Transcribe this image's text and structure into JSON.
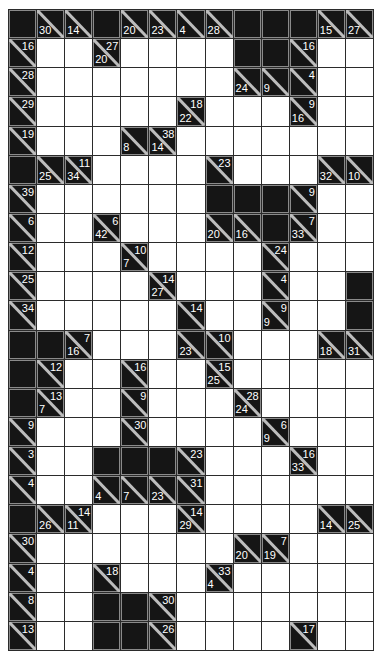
{
  "puzzle": {
    "type": "kakuro",
    "cols": 13,
    "rows": 22,
    "legend": {
      "B": "blocked cell",
      "W": "empty white entry cell",
      "clue": "[down_sum, across_sum] (null when absent)"
    },
    "colors": {
      "block": "#151515",
      "white": "#ffffff",
      "grid_line": "#2b2b2b",
      "clue_text": "#ffffff"
    },
    "grid": [
      [
        "B",
        [
          30,
          null
        ],
        [
          14,
          null
        ],
        "B",
        [
          20,
          null
        ],
        [
          23,
          null
        ],
        [
          4,
          null
        ],
        [
          28,
          null
        ],
        "B",
        "B",
        "B",
        [
          15,
          null
        ],
        [
          27,
          null
        ]
      ],
      [
        [
          null,
          16
        ],
        "W",
        "W",
        [
          20,
          27
        ],
        "W",
        "W",
        "W",
        "W",
        "B",
        "B",
        [
          null,
          16
        ],
        "W",
        "W"
      ],
      [
        [
          null,
          28
        ],
        "W",
        "W",
        "W",
        "W",
        "W",
        "W",
        "W",
        [
          24,
          null
        ],
        [
          9,
          null
        ],
        [
          null,
          4
        ],
        "W",
        "W"
      ],
      [
        [
          null,
          29
        ],
        "W",
        "W",
        "W",
        "W",
        "W",
        [
          22,
          18
        ],
        "W",
        "W",
        "W",
        [
          16,
          9
        ],
        "W",
        "W"
      ],
      [
        [
          null,
          19
        ],
        "W",
        "W",
        "W",
        [
          8,
          null
        ],
        [
          14,
          38
        ],
        "W",
        "W",
        "W",
        "W",
        "W",
        "W",
        "W"
      ],
      [
        "B",
        [
          25,
          null
        ],
        [
          34,
          11
        ],
        "W",
        "W",
        "W",
        "W",
        [
          null,
          23
        ],
        "W",
        "W",
        "W",
        [
          32,
          null
        ],
        [
          10,
          null
        ]
      ],
      [
        [
          null,
          39
        ],
        "W",
        "W",
        "W",
        "W",
        "W",
        "W",
        "B",
        "B",
        "B",
        [
          null,
          9
        ],
        "W",
        "W"
      ],
      [
        [
          null,
          6
        ],
        "W",
        "W",
        [
          42,
          6
        ],
        "W",
        "W",
        "W",
        [
          20,
          null
        ],
        [
          16,
          null
        ],
        "B",
        [
          33,
          7
        ],
        "W",
        "W"
      ],
      [
        [
          null,
          12
        ],
        "W",
        "W",
        "W",
        [
          7,
          10
        ],
        "W",
        "W",
        "W",
        "W",
        [
          null,
          24
        ],
        "W",
        "W",
        "W"
      ],
      [
        [
          null,
          25
        ],
        "W",
        "W",
        "W",
        "W",
        [
          27,
          14
        ],
        "W",
        "W",
        "W",
        [
          null,
          4
        ],
        "W",
        "W",
        "B"
      ],
      [
        [
          null,
          34
        ],
        "W",
        "W",
        "W",
        "W",
        "W",
        [
          null,
          14
        ],
        "W",
        "W",
        [
          9,
          9
        ],
        "W",
        "W",
        "B"
      ],
      [
        "B",
        "B",
        [
          16,
          7
        ],
        "W",
        "W",
        "W",
        [
          23,
          null
        ],
        [
          null,
          10
        ],
        "W",
        "W",
        "W",
        [
          18,
          null
        ],
        [
          31,
          null
        ]
      ],
      [
        "B",
        [
          null,
          12
        ],
        "W",
        "W",
        [
          null,
          16
        ],
        "W",
        "W",
        [
          25,
          15
        ],
        "W",
        "W",
        "W",
        "W",
        "W"
      ],
      [
        "B",
        [
          7,
          13
        ],
        "W",
        "W",
        [
          null,
          9
        ],
        "W",
        "W",
        "W",
        [
          24,
          28
        ],
        "W",
        "W",
        "W",
        "W"
      ],
      [
        [
          null,
          9
        ],
        "W",
        "W",
        "W",
        [
          null,
          30
        ],
        "W",
        "W",
        "W",
        "W",
        [
          9,
          6
        ],
        "W",
        "W",
        "W"
      ],
      [
        [
          null,
          3
        ],
        "W",
        "W",
        "B",
        "B",
        "B",
        [
          null,
          23
        ],
        "W",
        "W",
        "W",
        [
          33,
          16
        ],
        "W",
        "W"
      ],
      [
        [
          null,
          4
        ],
        "W",
        "W",
        [
          4,
          null
        ],
        [
          7,
          null
        ],
        [
          23,
          null
        ],
        [
          null,
          31
        ],
        "W",
        "W",
        "W",
        "W",
        "W",
        "W"
      ],
      [
        "B",
        [
          26,
          null
        ],
        [
          11,
          14
        ],
        "W",
        "W",
        "W",
        [
          29,
          14
        ],
        "W",
        "W",
        "W",
        "W",
        [
          14,
          null
        ],
        [
          25,
          null
        ]
      ],
      [
        [
          null,
          30
        ],
        "W",
        "W",
        "W",
        "W",
        "W",
        "W",
        "W",
        [
          20,
          null
        ],
        [
          19,
          7
        ],
        "W",
        "W",
        "W"
      ],
      [
        [
          null,
          4
        ],
        "W",
        "W",
        [
          null,
          18
        ],
        "W",
        "W",
        "W",
        [
          4,
          33
        ],
        "W",
        "W",
        "W",
        "W",
        "W"
      ],
      [
        [
          null,
          8
        ],
        "W",
        "W",
        "B",
        "B",
        [
          null,
          30
        ],
        "W",
        "W",
        "W",
        "W",
        "W",
        "W",
        "W"
      ],
      [
        [
          null,
          13
        ],
        "W",
        "W",
        "B",
        "B",
        [
          null,
          26
        ],
        "W",
        "W",
        "W",
        "W",
        [
          null,
          17
        ],
        "W",
        "W"
      ]
    ]
  }
}
